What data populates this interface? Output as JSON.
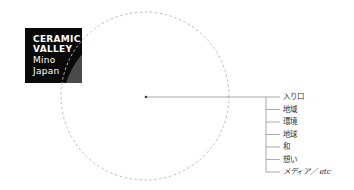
{
  "logo": {
    "line1": "CERAMIC",
    "line2": "VALLEY",
    "line3": "Mino",
    "line4": "Japan"
  },
  "diagram": {
    "circle": {
      "cx": 145,
      "cy": 96,
      "r": 84,
      "style": "dashed",
      "color": "#bdbdbd"
    },
    "labels": [
      "入り口",
      "地域",
      "環境",
      "地球",
      "和",
      "想い",
      "メディア／ etc"
    ]
  }
}
